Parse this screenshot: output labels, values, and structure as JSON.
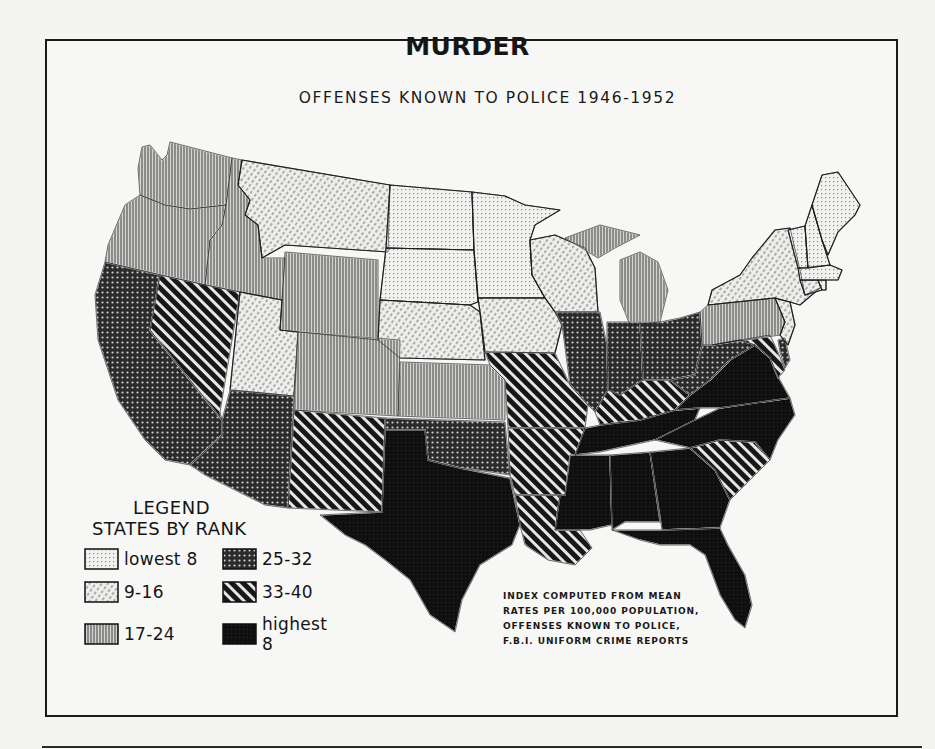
{
  "title": "MURDER",
  "subtitle": "OFFENSES KNOWN TO POLICE  1946-1952",
  "legend": {
    "heading": "LEGEND",
    "subheading": "STATES BY RANK",
    "classes": [
      {
        "id": "c1",
        "label": "lowest 8",
        "pattern": "fine-dots-grid"
      },
      {
        "id": "c2",
        "label": "9-16",
        "pattern": "light-diagonal-dashes"
      },
      {
        "id": "c3",
        "label": "17-24",
        "pattern": "vertical-lines"
      },
      {
        "id": "c4",
        "label": "25-32",
        "pattern": "dark-dots"
      },
      {
        "id": "c5",
        "label": "33-40",
        "pattern": "heavy-diagonal-stripes"
      },
      {
        "id": "c6",
        "label": "highest 8",
        "pattern": "solid-black"
      }
    ]
  },
  "note": [
    "INDEX COMPUTED FROM MEAN",
    "RATES PER 100,000 POPULATION,",
    "OFFENSES KNOWN TO POLICE,",
    "F.B.I. UNIFORM CRIME REPORTS"
  ],
  "chart_data": {
    "type": "choropleth",
    "title": "MURDER",
    "subtitle": "OFFENSES KNOWN TO POLICE 1946-1952",
    "metric": "Rank of mean murder rate per 100,000 population",
    "classes": [
      "lowest 8",
      "9-16",
      "17-24",
      "25-32",
      "33-40",
      "highest 8"
    ],
    "states": {
      "Washington": "17-24",
      "Oregon": "17-24",
      "Idaho": "17-24",
      "Wyoming": "17-24",
      "Colorado": "17-24",
      "Kansas": "17-24",
      "Michigan": "17-24",
      "Pennsylvania": "17-24",
      "Montana": "9-16",
      "Utah": "9-16",
      "Nebraska": "9-16",
      "Iowa": "9-16",
      "Wisconsin": "9-16",
      "New York": "9-16",
      "New Jersey": "9-16",
      "Connecticut": "9-16",
      "North Dakota": "lowest 8",
      "South Dakota": "lowest 8",
      "Minnesota": "lowest 8",
      "Maine": "lowest 8",
      "New Hampshire": "lowest 8",
      "Vermont": "lowest 8",
      "Massachusetts": "lowest 8",
      "Rhode Island": "lowest 8",
      "California": "25-32",
      "Arizona": "25-32",
      "Oklahoma": "25-32",
      "Illinois": "25-32",
      "Indiana": "25-32",
      "Ohio": "25-32",
      "West Virginia": "25-32",
      "Delaware": "25-32",
      "Nevada": "33-40",
      "New Mexico": "33-40",
      "Missouri": "33-40",
      "Arkansas": "33-40",
      "Louisiana": "33-40",
      "Kentucky": "33-40",
      "South Carolina": "33-40",
      "Maryland": "33-40",
      "Texas": "highest 8",
      "Mississippi": "highest 8",
      "Alabama": "highest 8",
      "Georgia": "highest 8",
      "Florida": "highest 8",
      "Tennessee": "highest 8",
      "North Carolina": "highest 8",
      "Virginia": "highest 8"
    },
    "note": "INDEX COMPUTED FROM MEAN RATES PER 100,000 POPULATION, OFFENSES KNOWN TO POLICE, F.B.I. UNIFORM CRIME REPORTS"
  },
  "map_shapes": [
    {
      "name": "Washington",
      "c": "c3",
      "d": "M142,147 L150,145 L162,160 L167,155 L170,142 L232,158 L226,205 L190,209 L165,205 L140,195 L138,168 Z"
    },
    {
      "name": "Oregon",
      "c": "c3",
      "d": "M140,195 L165,205 L190,209 L226,205 L222,225 L210,240 L205,285 L105,262 L108,245 L125,205 Z"
    },
    {
      "name": "Idaho",
      "c": "c3",
      "d": "M232,158 L242,160 L238,185 L250,200 L245,215 L258,225 L262,258 L285,258 L282,300 L205,285 L210,240 L222,225 L226,205 Z"
    },
    {
      "name": "Montana",
      "c": "c2",
      "d": "M242,160 L390,185 L388,252 L285,245 L262,258 L258,225 L245,215 L250,200 L238,185 Z"
    },
    {
      "name": "Wyoming",
      "c": "c3",
      "d": "M285,252 L378,260 L378,340 L280,330 L282,300 Z"
    },
    {
      "name": "North Dakota",
      "c": "c1",
      "d": "M390,185 L472,192 L474,250 L386,248 Z"
    },
    {
      "name": "South Dakota",
      "c": "c1",
      "d": "M386,248 L474,250 L478,302 L470,305 L380,300 Z"
    },
    {
      "name": "Nebraska",
      "c": "c2",
      "d": "M380,300 L470,305 L480,312 L485,360 L400,358 L378,340 Z"
    },
    {
      "name": "Minnesota",
      "c": "c1",
      "d": "M472,192 L505,196 L525,205 L560,210 L535,225 L530,240 L532,275 L545,298 L478,298 L474,250 Z"
    },
    {
      "name": "Wisconsin",
      "c": "c2",
      "d": "M530,240 L555,235 L585,248 L595,268 L598,312 L555,312 L545,298 L532,275 Z"
    },
    {
      "name": "Iowa",
      "c": "c2",
      "d": "M478,298 L545,298 L555,312 L562,325 L555,353 L485,352 L480,312 Z"
    },
    {
      "name": "Michigan",
      "c": "c3",
      "d": "M565,238 L600,225 L640,235 L615,248 L598,258 L585,250 Z M620,260 L640,252 L658,262 L668,290 L660,322 L630,325 L620,300 Z"
    },
    {
      "name": "California",
      "c": "c4",
      "d": "M105,262 L160,275 L150,330 L222,420 L222,435 L190,465 L165,460 L145,440 L118,400 L98,340 L95,295 Z"
    },
    {
      "name": "Nevada",
      "c": "c4x",
      "d": "M160,275 L240,292 L220,412 L222,420 L150,330 Z"
    },
    {
      "name": "Utah",
      "c": "c2",
      "d": "M240,292 L282,300 L280,330 L298,332 L294,396 L230,390 Z"
    },
    {
      "name": "Colorado",
      "c": "c3",
      "d": "M298,332 L400,340 L398,416 L294,410 Z"
    },
    {
      "name": "Kansas",
      "c": "c3",
      "d": "M400,362 L490,365 L505,380 L505,420 L398,416 Z"
    },
    {
      "name": "Arizona",
      "c": "c4",
      "d": "M230,390 L294,396 L288,508 L265,505 L205,475 L190,465 L222,435 L222,420 Z"
    },
    {
      "name": "New Mexico",
      "c": "c5",
      "d": "M294,410 L385,418 L382,512 L288,508 Z"
    },
    {
      "name": "Oklahoma",
      "c": "c4",
      "d": "M385,418 L505,422 L510,475 L490,472 L460,468 L428,460 L425,430 L385,430 Z"
    },
    {
      "name": "Texas",
      "c": "c6",
      "d": "M385,430 L425,430 L428,460 L460,468 L510,478 L520,525 L512,545 L480,565 L462,600 L455,632 L430,615 L410,580 L385,560 L365,545 L345,535 L320,515 L382,512 Z"
    },
    {
      "name": "Missouri",
      "c": "c5",
      "d": "M485,352 L555,353 L570,385 L588,405 L585,428 L508,428 L505,380 L490,365 Z"
    },
    {
      "name": "Arkansas",
      "c": "c5",
      "d": "M508,428 L585,428 L570,470 L565,495 L515,495 L510,475 Z"
    },
    {
      "name": "Louisiana",
      "c": "c5",
      "d": "M515,495 L560,495 L555,530 L580,530 L592,548 L575,565 L548,560 L525,545 L520,525 Z"
    },
    {
      "name": "Illinois",
      "c": "c4",
      "d": "M555,312 L600,312 L607,345 L608,390 L595,412 L588,405 L570,385 L562,325 Z"
    },
    {
      "name": "Indiana",
      "c": "c4",
      "d": "M607,322 L640,322 L643,380 L620,395 L608,390 L607,345 Z"
    },
    {
      "name": "Ohio",
      "c": "c4",
      "d": "M640,322 L660,322 L680,318 L700,312 L702,345 L695,375 L670,380 L643,380 Z"
    },
    {
      "name": "Kentucky",
      "c": "c5",
      "d": "M595,412 L608,390 L620,395 L643,380 L670,380 L690,395 L675,410 L640,420 L600,425 Z"
    },
    {
      "name": "Tennessee",
      "c": "c6",
      "d": "M575,455 L585,428 L600,425 L640,420 L675,410 L700,408 L695,420 L655,440 L600,452 Z"
    },
    {
      "name": "Mississippi",
      "c": "c6",
      "d": "M570,455 L610,455 L612,525 L590,530 L580,530 L555,530 L560,495 L565,495 Z"
    },
    {
      "name": "Alabama",
      "c": "c6",
      "d": "M610,455 L650,452 L660,522 L625,522 L612,530 Z"
    },
    {
      "name": "Georgia",
      "c": "c6",
      "d": "M650,452 L690,448 L715,470 L730,500 L720,528 L662,530 Z"
    },
    {
      "name": "Florida",
      "c": "c6",
      "d": "M612,530 L662,530 L720,528 L728,545 L745,575 L752,605 L745,628 L735,620 L720,595 L705,555 L690,545 L660,545 L640,540 Z"
    },
    {
      "name": "South Carolina",
      "c": "c5",
      "d": "M690,448 L720,440 L755,442 L770,460 L745,485 L730,500 L715,470 Z"
    },
    {
      "name": "North Carolina",
      "c": "c6",
      "d": "M695,420 L720,408 L790,398 L795,415 L778,440 L770,460 L755,442 L720,440 L690,448 L655,440 Z"
    },
    {
      "name": "Virginia",
      "c": "c6",
      "d": "M675,410 L690,395 L710,380 L730,360 L755,345 L770,358 L780,380 L790,398 L720,408 L700,408 Z"
    },
    {
      "name": "West Virginia",
      "c": "c4",
      "d": "M695,375 L702,345 L712,345 L740,340 L755,345 L730,360 L710,380 L690,395 L670,380 Z"
    },
    {
      "name": "Maryland",
      "c": "c5",
      "d": "M712,345 L770,335 L778,352 L785,370 L778,378 L770,358 L755,345 L740,340 Z"
    },
    {
      "name": "Delaware",
      "c": "c4",
      "d": "M778,340 L785,338 L790,360 L785,368 L780,352 Z"
    },
    {
      "name": "Pennsylvania",
      "c": "c3",
      "d": "M700,312 L708,305 L775,298 L785,322 L780,335 L712,345 L702,345 Z"
    },
    {
      "name": "New Jersey",
      "c": "c2",
      "d": "M775,298 L790,302 L795,325 L788,345 L780,335 L785,322 Z"
    },
    {
      "name": "New York",
      "c": "c2",
      "d": "M708,305 L712,290 L740,275 L752,258 L775,230 L790,228 L800,270 L805,295 L820,288 L800,305 L790,302 L775,298 Z"
    },
    {
      "name": "Connecticut",
      "c": "c2",
      "d": "M800,280 L818,280 L822,290 L805,295 Z"
    },
    {
      "name": "Rhode Island",
      "c": "c1",
      "d": "M818,280 L826,280 L826,290 L822,290 Z"
    },
    {
      "name": "Massachusetts",
      "c": "c1",
      "d": "M798,268 L830,265 L842,270 L838,280 L826,280 L800,280 Z"
    },
    {
      "name": "Vermont",
      "c": "c1",
      "d": "M788,230 L805,226 L808,268 L798,268 Z"
    },
    {
      "name": "New Hampshire",
      "c": "c1",
      "d": "M805,226 L812,205 L822,240 L830,265 L808,268 Z"
    },
    {
      "name": "Maine",
      "c": "c1",
      "d": "M812,205 L822,175 L838,172 L860,205 L855,215 L838,232 L828,255 L822,240 Z"
    }
  ]
}
